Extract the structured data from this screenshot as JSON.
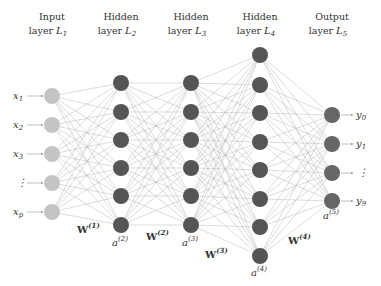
{
  "layers": [
    {
      "title": "Input",
      "subtitle": "layer",
      "name": "L",
      "index": "1",
      "x": 52,
      "ys": [
        96,
        125,
        154,
        183,
        212
      ],
      "color": "#c4c4c4",
      "node_labels": [
        "x1",
        "x2",
        "x3",
        "⋮",
        "xp"
      ],
      "activation": ""
    },
    {
      "title": "Hidden",
      "subtitle": "layer",
      "name": "L",
      "index": "2",
      "x": 121,
      "ys": [
        83,
        112,
        140,
        168,
        196,
        225
      ],
      "color": "#555555",
      "activation": "a(2)"
    },
    {
      "title": "Hidden",
      "subtitle": "layer",
      "name": "L",
      "index": "3",
      "x": 191,
      "ys": [
        83,
        112,
        140,
        168,
        196,
        225
      ],
      "color": "#555555",
      "activation": "a(3)"
    },
    {
      "title": "Hidden",
      "subtitle": "layer",
      "name": "L",
      "index": "4",
      "x": 260,
      "ys": [
        55,
        85,
        113,
        142,
        170,
        199,
        227,
        256
      ],
      "color": "#555555",
      "activation": "a(4)"
    },
    {
      "title": "Output",
      "subtitle": "layer",
      "name": "L",
      "index": "5",
      "x": 332,
      "ys": [
        115,
        144,
        173,
        201
      ],
      "color": "#666666",
      "node_labels": [
        "y0",
        "y1",
        "⋮",
        "y9"
      ],
      "activation": "a(5)"
    }
  ],
  "input_labels": [
    {
      "base": "x",
      "sub": "1"
    },
    {
      "base": "x",
      "sub": "2"
    },
    {
      "base": "x",
      "sub": "3"
    },
    {
      "base": "⋮",
      "sub": ""
    },
    {
      "base": "x",
      "sub": "p"
    }
  ],
  "output_labels": [
    {
      "base": "y",
      "sub": "0"
    },
    {
      "base": "y",
      "sub": "1"
    },
    {
      "base": "⋮",
      "sub": ""
    },
    {
      "base": "y",
      "sub": "9"
    }
  ],
  "weights": [
    {
      "base": "W",
      "sup": "(1)",
      "x": 77,
      "y": 233
    },
    {
      "base": "W",
      "sup": "(2)",
      "x": 146,
      "y": 240
    },
    {
      "base": "W",
      "sup": "(3)",
      "x": 205,
      "y": 258
    },
    {
      "base": "W",
      "sup": "(4)",
      "x": 288,
      "y": 244
    }
  ],
  "activations": [
    {
      "base": "a",
      "sup": "(2)",
      "x": 112,
      "y": 246
    },
    {
      "base": "a",
      "sup": "(3)",
      "x": 182,
      "y": 246
    },
    {
      "base": "a",
      "sup": "(4)",
      "x": 251,
      "y": 276
    },
    {
      "base": "a",
      "sup": "(5)",
      "x": 323,
      "y": 219
    }
  ],
  "colors": {
    "edge": "#b8b8b8",
    "input_node": "#c4c4c4",
    "hidden_node": "#555555",
    "output_node": "#666666",
    "text": "#333333"
  }
}
